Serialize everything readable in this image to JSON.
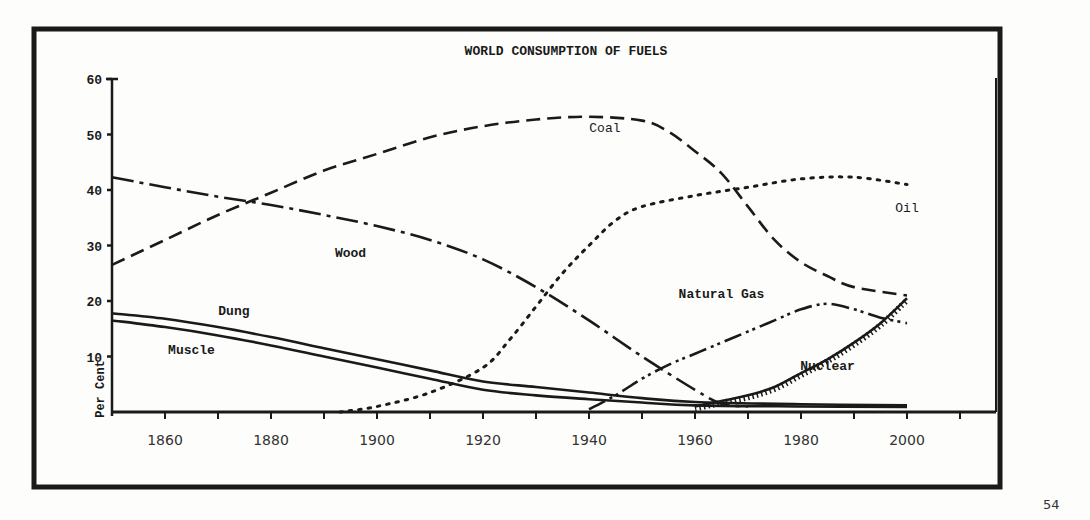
{
  "page": {
    "number": "54"
  },
  "chart_data": {
    "type": "line",
    "title": "WORLD CONSUMPTION OF FUELS",
    "xlabel": "",
    "ylabel": "Per Cent",
    "xlim": [
      1850,
      2010
    ],
    "ylim": [
      0,
      60
    ],
    "x_ticks": [
      1860,
      1880,
      1900,
      1920,
      1940,
      1960,
      1980,
      2000
    ],
    "x_minor_ticks": [
      1870,
      1890,
      1910,
      1930,
      1950,
      1970,
      1990,
      2010
    ],
    "y_ticks": [
      10,
      20,
      30,
      40,
      50,
      60
    ],
    "grid": false,
    "legend": "inline labels on curves",
    "series": [
      {
        "name": "Coal",
        "style": "dashed",
        "label_pos": {
          "x": 1943,
          "y": 50.5
        },
        "points": [
          [
            1850,
            26.5
          ],
          [
            1860,
            31
          ],
          [
            1870,
            35.5
          ],
          [
            1880,
            39.5
          ],
          [
            1890,
            43.5
          ],
          [
            1900,
            46.5
          ],
          [
            1910,
            49.5
          ],
          [
            1920,
            51.5
          ],
          [
            1930,
            52.7
          ],
          [
            1940,
            53.2
          ],
          [
            1950,
            52.5
          ],
          [
            1955,
            50.5
          ],
          [
            1960,
            47
          ],
          [
            1965,
            43
          ],
          [
            1970,
            37
          ],
          [
            1975,
            31
          ],
          [
            1980,
            27
          ],
          [
            1985,
            24.5
          ],
          [
            1990,
            22.5
          ],
          [
            2000,
            21
          ]
        ]
      },
      {
        "name": "Wood",
        "style": "dash-dot",
        "label_pos": {
          "x": 1895,
          "y": 28
        },
        "points": [
          [
            1850,
            42.3
          ],
          [
            1860,
            40.5
          ],
          [
            1870,
            38.8
          ],
          [
            1880,
            37.3
          ],
          [
            1890,
            35.5
          ],
          [
            1900,
            33.5
          ],
          [
            1910,
            31
          ],
          [
            1920,
            27.5
          ],
          [
            1930,
            22.5
          ],
          [
            1940,
            16.5
          ],
          [
            1950,
            10
          ],
          [
            1960,
            4
          ],
          [
            1965,
            1.5
          ],
          [
            1970,
            1
          ]
        ]
      },
      {
        "name": "Dung",
        "style": "solid",
        "label_pos": {
          "x": 1873,
          "y": 17.5
        },
        "points": [
          [
            1850,
            17.8
          ],
          [
            1860,
            16.8
          ],
          [
            1870,
            15.3
          ],
          [
            1880,
            13.5
          ],
          [
            1890,
            11.5
          ],
          [
            1900,
            9.5
          ],
          [
            1910,
            7.5
          ],
          [
            1920,
            5.5
          ],
          [
            1930,
            4.5
          ],
          [
            1940,
            3.5
          ],
          [
            1950,
            2.5
          ],
          [
            1960,
            1.8
          ],
          [
            1980,
            1.4
          ],
          [
            2000,
            1.2
          ]
        ]
      },
      {
        "name": "Muscle",
        "style": "solid",
        "label_pos": {
          "x": 1865,
          "y": 10.5
        },
        "points": [
          [
            1850,
            16.5
          ],
          [
            1860,
            15.3
          ],
          [
            1870,
            13.8
          ],
          [
            1880,
            12
          ],
          [
            1890,
            10
          ],
          [
            1900,
            8
          ],
          [
            1910,
            6
          ],
          [
            1920,
            4
          ],
          [
            1930,
            3
          ],
          [
            1940,
            2.3
          ],
          [
            1950,
            1.7
          ],
          [
            1960,
            1.2
          ],
          [
            1980,
            1
          ],
          [
            2000,
            0.9
          ]
        ]
      },
      {
        "name": "Oil",
        "style": "dotted",
        "label_pos": {
          "x": 2000,
          "y": 36
        },
        "points": [
          [
            1893,
            0
          ],
          [
            1900,
            1
          ],
          [
            1910,
            3.5
          ],
          [
            1920,
            8
          ],
          [
            1925,
            13
          ],
          [
            1930,
            19
          ],
          [
            1935,
            25
          ],
          [
            1940,
            30
          ],
          [
            1945,
            34.5
          ],
          [
            1950,
            37
          ],
          [
            1960,
            39
          ],
          [
            1970,
            40.5
          ],
          [
            1980,
            42
          ],
          [
            1990,
            42.3
          ],
          [
            2000,
            41
          ]
        ]
      },
      {
        "name": "Natural Gas",
        "style": "dash-dot-dot",
        "label_pos": {
          "x": 1965,
          "y": 20.5
        },
        "points": [
          [
            1940,
            0.5
          ],
          [
            1945,
            3
          ],
          [
            1950,
            6
          ],
          [
            1955,
            8.5
          ],
          [
            1960,
            10.5
          ],
          [
            1965,
            12.5
          ],
          [
            1970,
            14.5
          ],
          [
            1975,
            16.5
          ],
          [
            1980,
            18.5
          ],
          [
            1985,
            19.5
          ],
          [
            1990,
            18.5
          ],
          [
            1995,
            17
          ],
          [
            2000,
            16
          ]
        ]
      },
      {
        "name": "Nuclear",
        "style": "hatched-solid",
        "label_pos": {
          "x": 1985,
          "y": 7.5
        },
        "points": [
          [
            1960,
            1
          ],
          [
            1965,
            2
          ],
          [
            1970,
            3
          ],
          [
            1975,
            4.5
          ],
          [
            1980,
            7
          ],
          [
            1985,
            9.5
          ],
          [
            1990,
            12.5
          ],
          [
            1995,
            16
          ],
          [
            2000,
            20.5
          ]
        ]
      }
    ]
  },
  "y_axis_labels": [
    "60",
    "50",
    "40",
    "30",
    "20",
    "10"
  ],
  "x_axis_labels": [
    "1860",
    "1880",
    "1900",
    "1920",
    "1940",
    "1960",
    "1980",
    "2000"
  ]
}
